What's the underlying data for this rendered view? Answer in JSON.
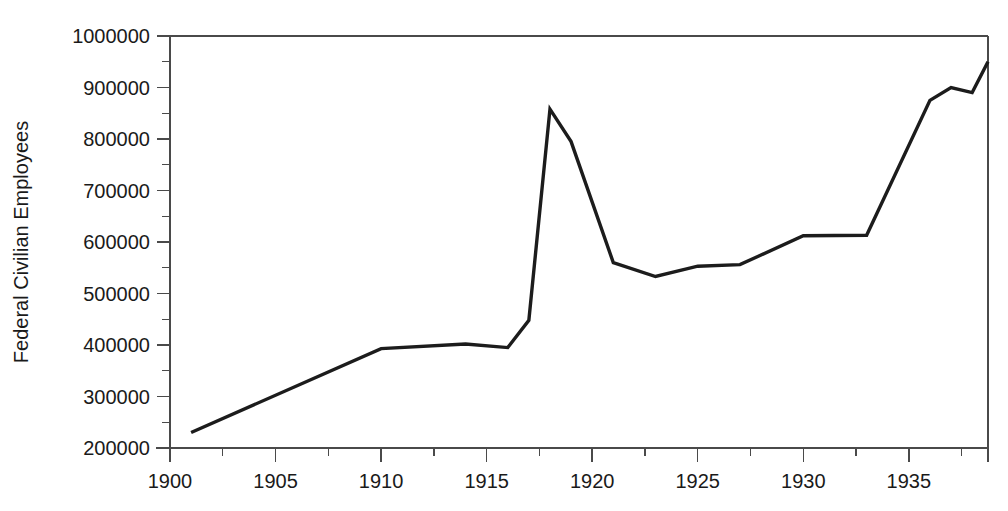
{
  "chart_data": {
    "type": "line",
    "title": "",
    "subtitle": "",
    "xlabel": "",
    "ylabel": "Federal Civilian Employees",
    "xlim": [
      1900,
      1938.75
    ],
    "ylim": [
      200000,
      1000000
    ],
    "grid": false,
    "legend": null,
    "legend_position": "none",
    "line_color": "#1c1c1c",
    "background_color": "#ffffff",
    "axis_color": "#4a4a4a",
    "x_tick_labels": [
      "1900",
      "1905",
      "1910",
      "1915",
      "1920",
      "1925",
      "1930",
      "1935"
    ],
    "x_tick_values": [
      1900,
      1905,
      1910,
      1915,
      1920,
      1925,
      1930,
      1935
    ],
    "x_minor_step": 2.5,
    "y_tick_labels": [
      "200000",
      "300000",
      "400000",
      "500000",
      "600000",
      "700000",
      "800000",
      "900000",
      "1000000"
    ],
    "y_tick_values": [
      200000,
      300000,
      400000,
      500000,
      600000,
      700000,
      800000,
      900000,
      1000000
    ],
    "y_minor_step": 50000,
    "series": [
      {
        "name": "Federal Civilian Employees",
        "x": [
          1901,
          1910,
          1914,
          1916,
          1917,
          1918,
          1919,
          1921,
          1923,
          1925,
          1927,
          1930,
          1933,
          1936,
          1937,
          1938,
          1938.75
        ],
        "values": [
          230000,
          393000,
          402000,
          395000,
          448000,
          858000,
          795000,
          560000,
          533000,
          553000,
          556000,
          612000,
          613000,
          875000,
          900000,
          890000,
          950000
        ]
      }
    ]
  }
}
